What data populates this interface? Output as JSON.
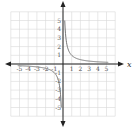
{
  "chart_data": {
    "type": "line",
    "title": "",
    "xlabel": "x",
    "ylabel": "y",
    "xlim": [
      -6,
      6
    ],
    "ylim": [
      -6,
      6
    ],
    "grid": true,
    "x_ticks": [
      "-5",
      "-4",
      "-3",
      "-2",
      "-1",
      "1",
      "2",
      "3",
      "4",
      "5"
    ],
    "y_ticks": [
      "5",
      "4",
      "3",
      "2",
      "1",
      "-1",
      "-2",
      "-3",
      "-4",
      "-5"
    ],
    "series": [
      {
        "name": "y = 1/x (positive branch)",
        "x": [
          0.2,
          0.25,
          0.333,
          0.5,
          1,
          2,
          3,
          4,
          5
        ],
        "y": [
          5,
          4,
          3,
          2,
          1,
          0.5,
          0.333,
          0.25,
          0.2
        ]
      },
      {
        "name": "y = 1/x (negative branch)",
        "x": [
          -5,
          -4,
          -3,
          -2,
          -1,
          -0.5,
          -0.333,
          -0.25,
          -0.2
        ],
        "y": [
          -0.2,
          -0.25,
          -0.333,
          -0.5,
          -1,
          -2,
          -3,
          -4,
          -5
        ]
      }
    ],
    "colors": {
      "grid": "#d9d9d9",
      "axis": "#222222",
      "curve": "#777777"
    }
  }
}
